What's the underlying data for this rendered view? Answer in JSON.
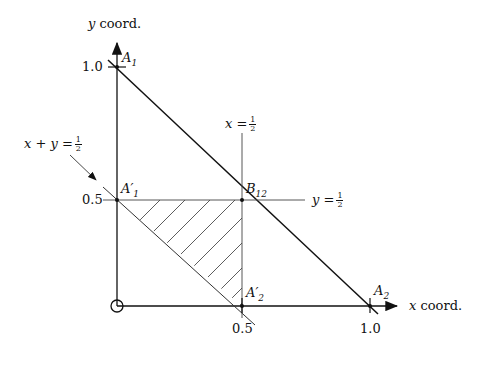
{
  "diagram": {
    "axes": {
      "x_label": "coord.",
      "x_var": "x",
      "y_label": "coord.",
      "y_var": "y",
      "x_ticks": [
        "0.5",
        "1.0"
      ],
      "y_ticks": [
        "1.0",
        "0.5"
      ]
    },
    "points": {
      "A1": {
        "base": "A",
        "sub": "1",
        "prime": ""
      },
      "A2": {
        "base": "A",
        "sub": "2",
        "prime": ""
      },
      "A1p": {
        "base": "A",
        "sub": "1",
        "prime": "′"
      },
      "A2p": {
        "base": "A",
        "sub": "2",
        "prime": "′"
      },
      "B12": {
        "base": "B",
        "sub": "12",
        "prime": ""
      }
    },
    "lines": {
      "x_half": {
        "lhs": "x =",
        "num": "1",
        "den": "2"
      },
      "y_half": {
        "lhs": "y =",
        "num": "1",
        "den": "2"
      },
      "sum_half": {
        "lhs": "x + y =",
        "num": "1",
        "den": "2"
      }
    },
    "colors": {
      "stroke": "#111111",
      "thin": "#333333",
      "background": "#ffffff"
    }
  }
}
